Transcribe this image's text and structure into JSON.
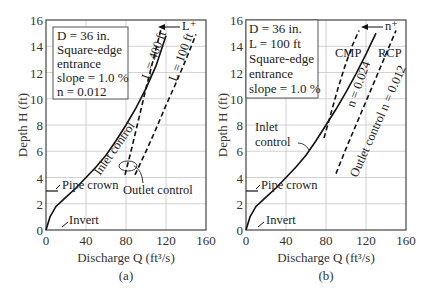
{
  "chart_data": [
    {
      "type": "line",
      "panel_label": "(a)",
      "xlabel": "Discharge Q (ft³/s)",
      "ylabel": "Depth H (ft)",
      "xlim": [
        0,
        160
      ],
      "ylim": [
        0,
        16
      ],
      "xticks": [
        0,
        40,
        80,
        120,
        160
      ],
      "yticks": [
        0,
        2,
        4,
        6,
        8,
        10,
        12,
        14,
        16
      ],
      "grid": true,
      "info_box": [
        "D = 36 in.",
        "Square-edge",
        "entrance",
        "slope = 1.0 %",
        "n = 0.012"
      ],
      "series": [
        {
          "name": "Inlet control",
          "style": "solid",
          "x": [
            0,
            4,
            10,
            20,
            30,
            40,
            50,
            60,
            70,
            80,
            90,
            100,
            110,
            120
          ],
          "y": [
            0,
            1,
            1.8,
            2.5,
            3.2,
            4.0,
            4.8,
            5.7,
            6.8,
            8.0,
            9.3,
            10.8,
            12.5,
            14.8
          ]
        },
        {
          "name": "L = 400 ft",
          "style": "dashed",
          "x": [
            79,
            85,
            90,
            95,
            100,
            105,
            110,
            115
          ],
          "y": [
            4.2,
            6.0,
            7.6,
            9.2,
            10.8,
            12.3,
            13.8,
            15.3
          ]
        },
        {
          "name": "L = 100 ft",
          "style": "dashed",
          "x": [
            89,
            100,
            110,
            120,
            130,
            140,
            150
          ],
          "y": [
            4.2,
            6.0,
            7.7,
            9.5,
            11.2,
            13.0,
            14.9
          ]
        }
      ],
      "annotations": [
        "Inlet control",
        "L = 400 ft",
        "L = 100 ft",
        "L⁺",
        "Pipe crown",
        "Invert",
        "Outlet control"
      ],
      "pipe_crown_depth": 3,
      "invert_depth": 0
    },
    {
      "type": "line",
      "panel_label": "(b)",
      "xlabel": "Discharge Q (ft³/s)",
      "ylabel": "Depth H (ft)",
      "xlim": [
        0,
        160
      ],
      "ylim": [
        0,
        16
      ],
      "xticks": [
        0,
        40,
        80,
        120,
        160
      ],
      "yticks": [
        0,
        2,
        4,
        6,
        8,
        10,
        12,
        14,
        16
      ],
      "grid": true,
      "info_box": [
        "D = 36 in.",
        "L = 100 ft",
        "Square-edge",
        "entrance",
        "slope = 1.0 %"
      ],
      "series": [
        {
          "name": "Inlet control",
          "style": "solid",
          "x": [
            0,
            4,
            10,
            20,
            30,
            40,
            50,
            60,
            70,
            80,
            90,
            100,
            110,
            120,
            130
          ],
          "y": [
            0,
            1,
            1.8,
            2.5,
            3.2,
            4.0,
            4.8,
            5.7,
            6.8,
            8.0,
            9.2,
            10.5,
            11.9,
            13.4,
            15.0
          ]
        },
        {
          "name": "CMP n = 0.024",
          "style": "dashed",
          "x": [
            78,
            85,
            92,
            99,
            106,
            113
          ],
          "y": [
            7.0,
            8.9,
            10.8,
            12.5,
            14.0,
            15.2
          ]
        },
        {
          "name": "RCP Outlet control n = 0.012",
          "style": "dashed",
          "x": [
            90,
            100,
            110,
            120,
            130,
            140,
            150
          ],
          "y": [
            4.3,
            6.2,
            8.0,
            9.8,
            11.6,
            13.4,
            15.2
          ]
        }
      ],
      "annotations": [
        "Inlet control",
        "CMP",
        "RCP",
        "n = 0.024",
        "Outlet control n = 0.012",
        "n⁺",
        "Pipe crown",
        "Invert"
      ],
      "pipe_crown_depth": 3,
      "invert_depth": 0
    }
  ],
  "panels": {
    "a": {
      "label": "(a)",
      "xlabel": "Discharge Q (ft³/s)",
      "ylabel": "Depth H (ft)",
      "box": [
        "D = 36 in.",
        "Square-edge",
        "entrance",
        "slope = 1.0 %",
        "n = 0.012"
      ],
      "ann_l400": "L = 400 ft",
      "ann_l100": "L = 100 ft",
      "ann_lplus": "L⁺",
      "ann_inlet": "Inlet control",
      "ann_outlet": "Outlet control",
      "ann_crown": "Pipe crown",
      "ann_invert": "Invert"
    },
    "b": {
      "label": "(b)",
      "xlabel": "Discharge Q (ft³/s)",
      "ylabel": "Depth H (ft)",
      "box": [
        "D = 36 in.",
        "L = 100 ft",
        "Square-edge",
        "entrance",
        "slope = 1.0 %"
      ],
      "ann_cmp": "CMP",
      "ann_rcp": "RCP",
      "ann_n024": "n = 0.024",
      "ann_outlet": "Outlet control n = 0.012",
      "ann_nplus": "n⁺",
      "ann_inlet1": "Inlet",
      "ann_inlet2": "control",
      "ann_crown": "Pipe crown",
      "ann_invert": "Invert"
    },
    "ticks_x": [
      "0",
      "40",
      "80",
      "120",
      "160"
    ],
    "ticks_y": [
      "0",
      "2",
      "4",
      "6",
      "8",
      "10",
      "12",
      "14",
      "16"
    ]
  }
}
